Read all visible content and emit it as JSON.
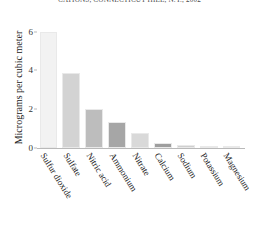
{
  "chart_data": {
    "type": "bar",
    "title": "CATIONS, CONNECTICUT HILL, N.Y., 2002",
    "xlabel": "",
    "ylabel": "Micrograms per cubic meter",
    "ylim": [
      0,
      6.6
    ],
    "yticks": [
      "0",
      "2",
      "4",
      "6"
    ],
    "ytickvalues": [
      0,
      2,
      4,
      6
    ],
    "grid": false,
    "legend": "none",
    "categories": [
      "Sulfur dioxide",
      "Sulfate",
      "Nitric acid",
      "Ammonium",
      "Nitrate",
      "Calcium",
      "Sodium",
      "Potassium",
      "Magnesium"
    ],
    "values": [
      6.0,
      3.85,
      2.0,
      1.35,
      0.8,
      0.28,
      0.14,
      0.12,
      0.1
    ],
    "bar_colors": [
      "#f2f2f2",
      "#d3d3d3",
      "#bdbdbd",
      "#a6a6a6",
      "#d9d9d9",
      "#9e9e9e",
      "#cfcfcf",
      "#d4d4d4",
      "#cccccc"
    ]
  }
}
